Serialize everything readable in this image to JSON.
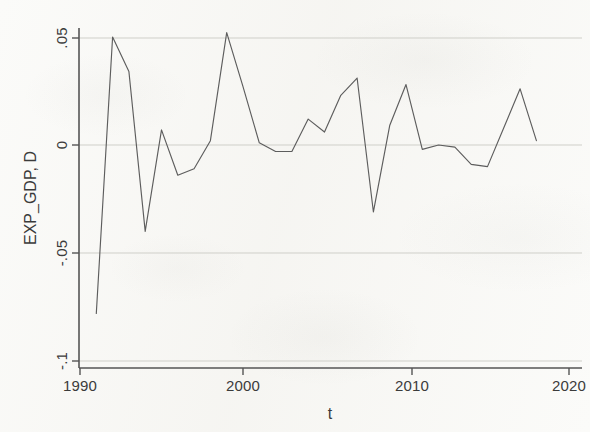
{
  "chart_data": {
    "type": "line",
    "title": "",
    "xlabel": "t",
    "ylabel": "EXP_GDP, D",
    "xlim": [
      1990,
      2020
    ],
    "ylim": [
      -0.1,
      0.055
    ],
    "grid": true,
    "legend": "none",
    "xticks": [
      1990,
      2000,
      2010,
      2020
    ],
    "xticklabels": [
      "1990",
      "2000",
      "2010",
      "2020"
    ],
    "yticks": [
      0.05,
      0,
      -0.05,
      -0.1
    ],
    "yticklabels": [
      ".05",
      "0",
      "-.05",
      "-.1"
    ],
    "series": [
      {
        "name": "EXP_GDP, D",
        "color": "#5d5d5d",
        "x": [
          1991,
          1992,
          1993,
          1994,
          1995,
          1996,
          1997,
          1998,
          1999,
          2000,
          2001,
          2002,
          2003,
          2004,
          2005,
          2006,
          2007,
          2008,
          2009,
          2010,
          2011,
          2012,
          2013,
          2014,
          2015,
          2016,
          2017,
          2018
        ],
        "y": [
          -0.078,
          0.05,
          0.034,
          -0.04,
          0.007,
          -0.014,
          -0.011,
          0.002,
          0.052,
          0.027,
          0.001,
          -0.003,
          -0.003,
          0.012,
          0.006,
          0.023,
          0.031,
          -0.031,
          0.009,
          0.028,
          -0.002,
          0.0,
          -0.001,
          -0.009,
          -0.01,
          0.008,
          0.026,
          0.002
        ]
      }
    ]
  },
  "axis": {
    "x_title": "t",
    "y_title": "EXP_GDP, D"
  }
}
